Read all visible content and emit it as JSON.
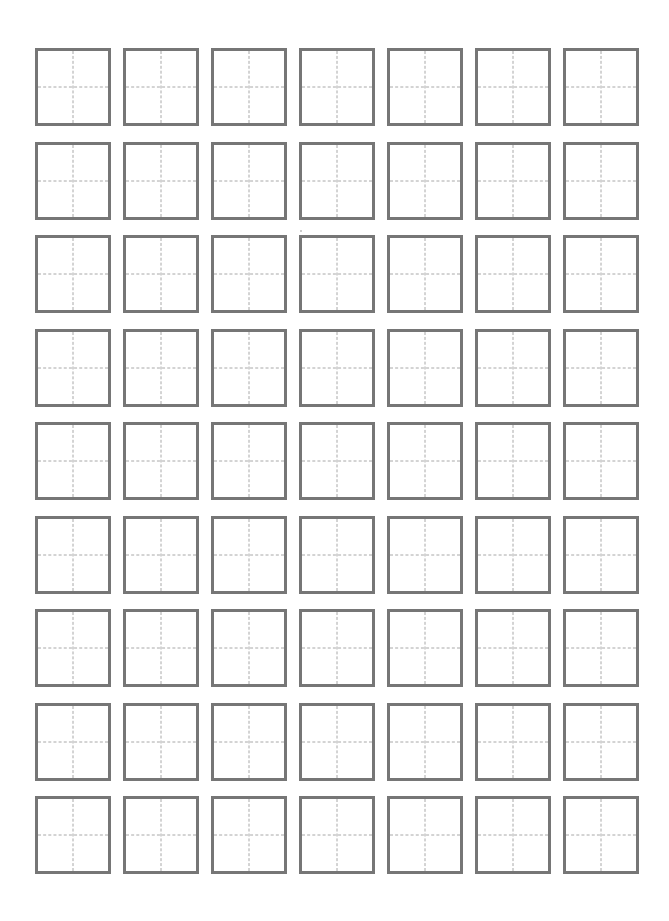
{
  "sheet": {
    "type": "tianzige-practice-grid",
    "rows": 9,
    "columns": 7,
    "cell_guides": [
      "vertical-dashed-center",
      "horizontal-dashed-center"
    ],
    "colors": {
      "border": "#767676",
      "guide": "#a8a8a8",
      "background": "#ffffff"
    }
  }
}
